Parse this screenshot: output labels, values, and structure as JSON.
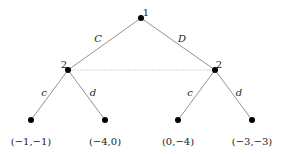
{
  "tree": {
    "root": {
      "player": "1",
      "x": 141,
      "y": 18
    },
    "actions_p1": [
      {
        "label": "C",
        "lx": 96,
        "ly": 38
      },
      {
        "label": "D",
        "lx": 182,
        "ly": 38
      }
    ],
    "p2_nodes": [
      {
        "player": "2",
        "x": 68,
        "y": 70
      },
      {
        "player": "2",
        "x": 215,
        "y": 70
      }
    ],
    "information_set": "dashed line connecting player 2 nodes",
    "actions_p2": [
      {
        "label": "c",
        "lx": 43,
        "ly": 91
      },
      {
        "label": "d",
        "lx": 93,
        "ly": 91
      },
      {
        "label": "c",
        "lx": 190,
        "ly": 91
      },
      {
        "label": "d",
        "lx": 239,
        "ly": 91
      }
    ],
    "leaves": [
      {
        "payoff": "(−1,−1)",
        "x": 31,
        "y": 120
      },
      {
        "payoff": "(−4,0)",
        "x": 105,
        "y": 120
      },
      {
        "payoff": "(0,−4)",
        "x": 178,
        "y": 120
      },
      {
        "payoff": "(−3,−3)",
        "x": 252,
        "y": 120
      }
    ]
  }
}
